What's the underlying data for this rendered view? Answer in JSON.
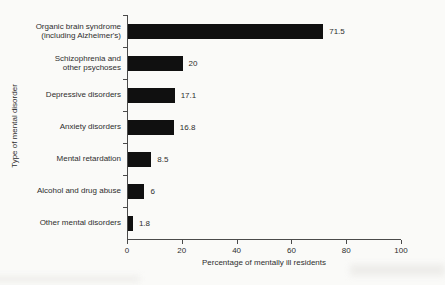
{
  "figure": {
    "background": "#fafaf8",
    "text_color": "#2e2e2e",
    "axis_color": "#4a4a4a"
  },
  "chart_data": {
    "type": "bar",
    "orientation": "horizontal",
    "title": "",
    "xlabel": "Percentage of mentally ill residents",
    "ylabel": "Type of mental disorder",
    "xlim": [
      0,
      100
    ],
    "xticks": [
      0,
      20,
      40,
      60,
      80,
      100
    ],
    "grid": false,
    "legend": null,
    "bar_color": "#101010",
    "categories": [
      "Organic brain syndrome\n(including Alzheimer's)",
      "Schizophrenia and\nother psychoses",
      "Depressive disorders",
      "Anxiety disorders",
      "Mental retardation",
      "Alcohol and drug abuse",
      "Other mental disorders"
    ],
    "values": [
      71.5,
      20,
      17.1,
      16.8,
      8.5,
      6,
      1.8
    ],
    "value_labels": [
      "71.5",
      "20",
      "17.1",
      "16.8",
      "8.5",
      "6",
      "1.8"
    ]
  }
}
